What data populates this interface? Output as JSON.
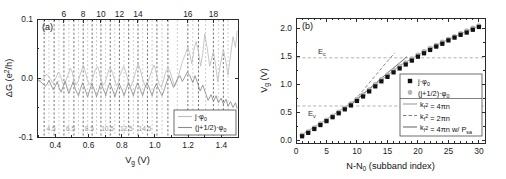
{
  "figure": {
    "panel_a_tag": "(a)",
    "panel_b_tag": "(b)"
  },
  "panel_a": {
    "tag": "(a)",
    "ylabel": "ΔG (e²/h)",
    "xlabel": "V_g (V)",
    "xlabel_main": "V",
    "xlabel_sub": "g",
    "xlabel_unit": " (V)",
    "ylabel_main": "ΔG (e",
    "ylabel_sup": "2",
    "ylabel_tail": "/h)",
    "yticks": [
      "0.1",
      "0.0",
      "-0.1"
    ],
    "ytick_values": [
      0.1,
      0.0,
      -0.1
    ],
    "xticks": [
      "0.4",
      "0.6",
      "0.8",
      "1.0",
      "1.2",
      "1.4"
    ],
    "xtick_values": [
      0.4,
      0.6,
      0.8,
      1.0,
      1.2,
      1.4
    ],
    "top_labels": [
      "6",
      "8",
      "10",
      "12",
      "14",
      "16",
      "18"
    ],
    "top_label_positions": [
      0.452,
      0.568,
      0.675,
      0.786,
      0.898,
      1.198,
      1.352
    ],
    "inner_gray_labels": [
      "4.5",
      "6.5",
      "8.5",
      "10.5",
      "12.5",
      "14.5"
    ],
    "inner_gray_positions": [
      0.375,
      0.492,
      0.605,
      0.715,
      0.828,
      0.94
    ],
    "legend": [
      {
        "label": "j·φ₀",
        "label_main": "j·φ",
        "label_sub": "0",
        "color": "#bdbdbd",
        "style": "solid"
      },
      {
        "label": "(j+1/2)·φ₀",
        "label_main": "(j+1/2)·φ",
        "label_sub": "0",
        "color": "#8a8a8a",
        "style": "solid"
      }
    ],
    "xlim": [
      0.29,
      1.5
    ],
    "ylim": [
      -0.1,
      0.1
    ]
  },
  "panel_b": {
    "tag": "(b)",
    "xlabel": "N-N₀ (subband index)",
    "xlabel_main": "N-N",
    "xlabel_sub": "0",
    "xlabel_tail": " (subband index)",
    "ylabel": "V_g (V)",
    "ylabel_main": "V",
    "ylabel_sub": "g",
    "ylabel_tail": " (V)",
    "xticks": [
      "0",
      "5",
      "10",
      "15",
      "20",
      "25",
      "30"
    ],
    "xtick_values": [
      0,
      5,
      10,
      15,
      20,
      25,
      30
    ],
    "yticks": [
      "0.0",
      "0.5",
      "1.0",
      "1.5",
      "2.0"
    ],
    "ytick_values": [
      0.0,
      0.5,
      1.0,
      1.5,
      2.0
    ],
    "xlim": [
      0,
      31
    ],
    "ylim": [
      -0.05,
      2.18
    ],
    "annotations": [
      {
        "name": "E_c",
        "text_main": "E",
        "text_sub": "c",
        "value": 1.47
      },
      {
        "name": "E_v",
        "text_main": "E",
        "text_sub": "v",
        "value": 0.61
      }
    ],
    "legend": [
      {
        "label": "j·φ₀",
        "label_main": "j·φ",
        "label_sub": "0",
        "marker": "square",
        "color": "#111111"
      },
      {
        "label": "(j+1/2)·φ₀",
        "label_main": "(j+1/2)·φ",
        "label_sub": "0",
        "marker": "circle",
        "color": "#b6b6b6"
      },
      {
        "label": "k_f² = 4πn",
        "label_main": "k",
        "label_sub": "f",
        "label_sup": "2",
        "label_tail": " = 4πn",
        "marker": "line-solid",
        "color": "#9d9d9d"
      },
      {
        "label": "k_f² = 2πn",
        "label_main": "k",
        "label_sub": "f",
        "label_sup": "2",
        "label_tail": " = 2πn",
        "marker": "line-dashed",
        "color": "#7a7a7a"
      },
      {
        "label": "k_f² = 4πn w/ P_sa",
        "label_main": "k",
        "label_sub": "f",
        "label_sup": "2",
        "label_tail": " = 4πn w/ P",
        "label_tail_sub": "sa",
        "marker": "line-solid",
        "color": "#6e6e6e"
      }
    ]
  },
  "chart_data": [
    {
      "type": "line",
      "title": "(a)",
      "xlabel": "V_g (V)",
      "ylabel": "ΔG (e2/h)",
      "xlim": [
        0.29,
        1.5
      ],
      "ylim": [
        -0.1,
        0.1
      ],
      "grid": false,
      "legend_position": "lower-right",
      "xticks": [
        0.4,
        0.6,
        0.8,
        1.0,
        1.2,
        1.4
      ],
      "yticks": [
        -0.1,
        0.0,
        0.1
      ],
      "top_axis_ticks": [
        6,
        8,
        10,
        12,
        14,
        16,
        18
      ],
      "top_axis_tick_positions": [
        0.452,
        0.568,
        0.675,
        0.786,
        0.898,
        1.198,
        1.352
      ],
      "inner_gray_ticks": [
        4.5,
        6.5,
        8.5,
        10.5,
        12.5,
        14.5
      ],
      "inner_gray_tick_positions": [
        0.375,
        0.492,
        0.605,
        0.715,
        0.828,
        0.94
      ],
      "vertical_lines_j": [
        0.333,
        0.393,
        0.452,
        0.512,
        0.568,
        0.622,
        0.675,
        0.731,
        0.786,
        0.842,
        0.898,
        0.955,
        1.012,
        1.078,
        1.198,
        1.262,
        1.352,
        1.412
      ],
      "vertical_lines_jhalf": [
        0.362,
        0.422,
        0.482,
        0.54,
        0.595,
        0.648,
        0.703,
        0.758,
        0.814,
        0.87,
        0.926,
        0.983,
        1.043,
        1.135,
        1.228,
        1.305,
        1.382,
        1.44
      ],
      "series": [
        {
          "name": "j·φ₀",
          "color": "#bdbdbd",
          "x": [
            0.295,
            0.31,
            0.325,
            0.333,
            0.345,
            0.358,
            0.37,
            0.382,
            0.393,
            0.405,
            0.418,
            0.43,
            0.442,
            0.452,
            0.465,
            0.478,
            0.49,
            0.5,
            0.512,
            0.525,
            0.538,
            0.55,
            0.562,
            0.568,
            0.58,
            0.592,
            0.605,
            0.618,
            0.63,
            0.642,
            0.655,
            0.665,
            0.675,
            0.688,
            0.7,
            0.712,
            0.722,
            0.731,
            0.745,
            0.758,
            0.77,
            0.782,
            0.786,
            0.8,
            0.812,
            0.825,
            0.838,
            0.842,
            0.855,
            0.868,
            0.88,
            0.892,
            0.898,
            0.912,
            0.925,
            0.938,
            0.95,
            0.955,
            0.968,
            0.982,
            0.995,
            1.005,
            1.012,
            1.025,
            1.038,
            1.05,
            1.062,
            1.078,
            1.092,
            1.105,
            1.118,
            1.13,
            1.142,
            1.155,
            1.168,
            1.182,
            1.198,
            1.21,
            1.222,
            1.235,
            1.248,
            1.262,
            1.275,
            1.288,
            1.3,
            1.315,
            1.33,
            1.352,
            1.365,
            1.378,
            1.392,
            1.412,
            1.425,
            1.44,
            1.455,
            1.47,
            1.485,
            1.495
          ],
          "y": [
            -0.003,
            -0.004,
            -0.002,
            0.001,
            0.006,
            0.004,
            -0.002,
            -0.008,
            -0.006,
            0.001,
            0.01,
            0.005,
            -0.006,
            -0.012,
            -0.004,
            0.006,
            0.017,
            0.012,
            -0.002,
            -0.012,
            -0.006,
            0.006,
            0.016,
            0.022,
            0.012,
            -0.002,
            -0.012,
            -0.008,
            0.004,
            0.015,
            0.02,
            0.011,
            -0.002,
            -0.012,
            -0.008,
            0.004,
            0.014,
            0.018,
            0.008,
            -0.004,
            -0.013,
            -0.007,
            0.002,
            0.013,
            0.02,
            0.01,
            -0.004,
            -0.01,
            -0.014,
            -0.005,
            0.007,
            0.018,
            0.024,
            0.014,
            -0.001,
            -0.012,
            -0.016,
            -0.01,
            0.002,
            0.014,
            0.022,
            0.012,
            0.002,
            -0.01,
            -0.016,
            -0.006,
            0.008,
            0.018,
            0.01,
            -0.002,
            -0.014,
            -0.008,
            0.004,
            0.018,
            0.03,
            0.04,
            0.052,
            0.04,
            0.024,
            0.048,
            0.062,
            0.045,
            0.02,
            0.042,
            0.075,
            0.05,
            0.02,
            0.045,
            0.022,
            -0.006,
            0.02,
            0.048,
            0.03,
            0.005,
            0.038,
            0.07,
            0.052,
            0.08
          ]
        },
        {
          "name": "(j+1/2)·φ₀",
          "color": "#8a8a8a",
          "x": [
            0.295,
            0.31,
            0.325,
            0.34,
            0.352,
            0.362,
            0.375,
            0.388,
            0.4,
            0.412,
            0.422,
            0.435,
            0.448,
            0.46,
            0.472,
            0.482,
            0.495,
            0.508,
            0.52,
            0.532,
            0.54,
            0.552,
            0.565,
            0.578,
            0.59,
            0.595,
            0.608,
            0.62,
            0.632,
            0.645,
            0.648,
            0.662,
            0.675,
            0.688,
            0.7,
            0.703,
            0.715,
            0.728,
            0.742,
            0.755,
            0.758,
            0.772,
            0.785,
            0.798,
            0.81,
            0.814,
            0.828,
            0.84,
            0.852,
            0.865,
            0.87,
            0.882,
            0.895,
            0.908,
            0.92,
            0.926,
            0.938,
            0.952,
            0.965,
            0.978,
            0.983,
            0.995,
            1.008,
            1.022,
            1.035,
            1.043,
            1.058,
            1.072,
            1.085,
            1.098,
            1.112,
            1.125,
            1.135,
            1.15,
            1.165,
            1.18,
            1.195,
            1.21,
            1.228,
            1.242,
            1.258,
            1.272,
            1.288,
            1.305,
            1.32,
            1.338,
            1.352,
            1.368,
            1.382,
            1.398,
            1.412,
            1.428,
            1.44,
            1.455,
            1.47,
            1.485,
            1.495
          ],
          "y": [
            -0.004,
            -0.006,
            -0.01,
            -0.014,
            -0.01,
            -0.004,
            -0.012,
            -0.02,
            -0.014,
            -0.006,
            -0.016,
            -0.024,
            -0.014,
            -0.005,
            -0.018,
            -0.026,
            -0.016,
            -0.006,
            -0.018,
            -0.026,
            -0.03,
            -0.018,
            -0.008,
            -0.018,
            -0.028,
            -0.032,
            -0.02,
            -0.01,
            -0.018,
            -0.028,
            -0.032,
            -0.02,
            -0.008,
            -0.018,
            -0.026,
            -0.03,
            -0.018,
            -0.008,
            -0.018,
            -0.028,
            -0.032,
            -0.02,
            -0.01,
            -0.018,
            -0.026,
            -0.03,
            -0.018,
            -0.008,
            -0.016,
            -0.026,
            -0.03,
            -0.018,
            -0.008,
            -0.016,
            -0.026,
            -0.03,
            -0.018,
            -0.008,
            -0.016,
            -0.026,
            -0.03,
            -0.018,
            -0.01,
            -0.018,
            -0.026,
            -0.03,
            -0.018,
            -0.006,
            0.004,
            -0.006,
            -0.016,
            -0.008,
            -0.002,
            0.004,
            -0.006,
            0.002,
            0.01,
            0.004,
            -0.008,
            0.004,
            -0.01,
            -0.022,
            -0.012,
            -0.026,
            -0.038,
            -0.028,
            -0.04,
            -0.03,
            -0.042,
            -0.034,
            -0.044,
            -0.036,
            -0.048,
            -0.04,
            -0.05,
            -0.042,
            -0.052,
            -0.045
          ]
        }
      ]
    },
    {
      "type": "scatter",
      "title": "(b)",
      "xlabel": "N-N0 (subband index)",
      "ylabel": "Vg (V)",
      "xlim": [
        0,
        31
      ],
      "ylim": [
        -0.05,
        2.18
      ],
      "grid": false,
      "legend_position": "center-right",
      "xticks": [
        0,
        5,
        10,
        15,
        20,
        25,
        30
      ],
      "yticks": [
        0.0,
        0.5,
        1.0,
        1.5,
        2.0
      ],
      "hlines": [
        {
          "label": "E_c",
          "y": 1.47
        },
        {
          "label": "E_v",
          "y": 0.61
        }
      ],
      "series": [
        {
          "name": "j·φ₀",
          "marker": "square",
          "color": "#111111",
          "x": [
            1,
            2,
            3,
            4,
            5,
            6,
            7,
            8,
            9,
            10,
            11,
            12,
            13,
            14,
            15,
            16,
            17,
            18,
            19,
            20,
            21,
            22,
            23,
            24,
            25,
            26,
            27,
            28,
            29,
            30
          ],
          "y": [
            0.07,
            0.13,
            0.2,
            0.27,
            0.34,
            0.41,
            0.48,
            0.55,
            0.62,
            0.7,
            0.78,
            0.87,
            0.96,
            1.05,
            1.13,
            1.21,
            1.28,
            1.35,
            1.42,
            1.49,
            1.55,
            1.61,
            1.67,
            1.72,
            1.78,
            1.83,
            1.88,
            1.92,
            1.97,
            2.02
          ]
        },
        {
          "name": "(j+1/2)·φ₀",
          "marker": "circle",
          "color": "#b6b6b6",
          "x": [
            1,
            2,
            3,
            4,
            5,
            6,
            7,
            8,
            9,
            10,
            11,
            12,
            13,
            14,
            15,
            16,
            17,
            18,
            19,
            20,
            21,
            22,
            23,
            24,
            25,
            26,
            27,
            28,
            29,
            30
          ],
          "y": [
            0.09,
            0.15,
            0.22,
            0.29,
            0.36,
            0.43,
            0.5,
            0.57,
            0.65,
            0.73,
            0.81,
            0.9,
            0.99,
            1.08,
            1.16,
            1.24,
            1.31,
            1.38,
            1.45,
            1.52,
            1.58,
            1.64,
            1.69,
            1.75,
            1.8,
            1.85,
            1.9,
            1.95,
            2.0,
            2.04
          ]
        },
        {
          "name": "k_f² = 4πn",
          "marker": "line-solid",
          "color": "#9d9d9d",
          "x": [
            1,
            5,
            9,
            13,
            17,
            21,
            25,
            30
          ],
          "y": [
            0.1,
            0.37,
            0.66,
            0.99,
            1.33,
            1.58,
            1.8,
            2.04
          ]
        },
        {
          "name": "k_f² = 2πn",
          "marker": "line-dashed",
          "color": "#7a7a7a",
          "x": [
            9.0,
            11.0,
            13.0,
            15.0,
            16.2
          ],
          "y": [
            0.63,
            0.89,
            1.15,
            1.41,
            1.56
          ]
        },
        {
          "name": "k_f² = 4πn w/ P_sa",
          "marker": "line-solid",
          "color": "#6e6e6e",
          "x": [
            9.0,
            11.0,
            13.0,
            15.0,
            17.0,
            18.2
          ],
          "y": [
            0.63,
            0.82,
            1.01,
            1.2,
            1.38,
            1.49
          ]
        }
      ]
    }
  ]
}
